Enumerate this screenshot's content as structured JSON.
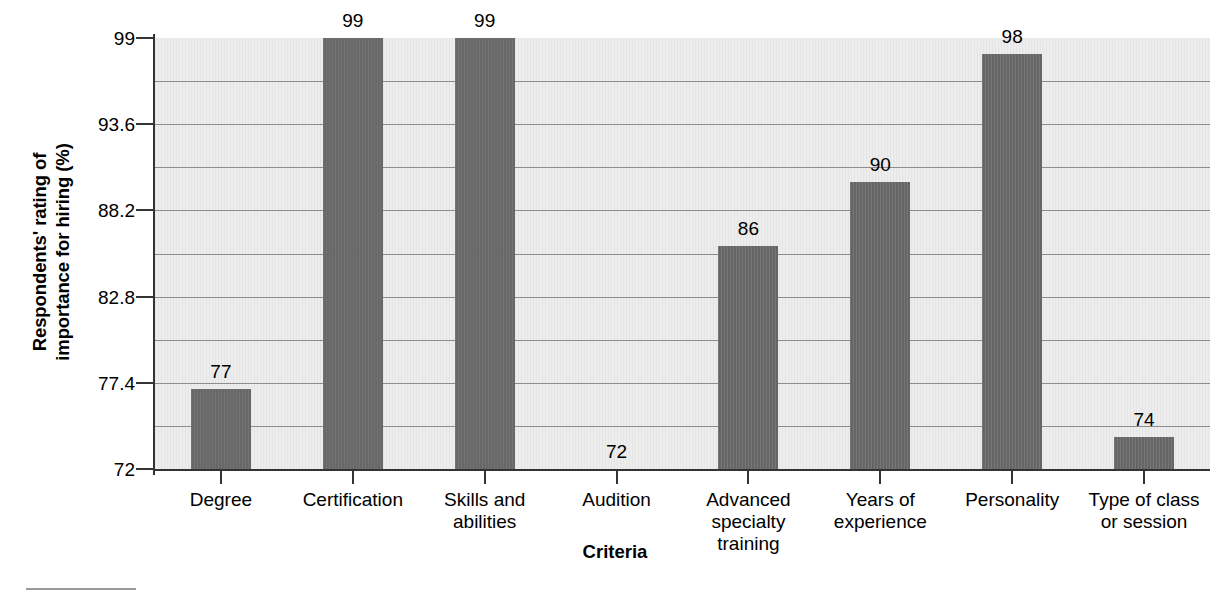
{
  "chart_data": {
    "type": "bar",
    "title": "",
    "xlabel": "Criteria",
    "ylabel": "Respondents' rating of importance for hiring (%)",
    "ylabel_lines": [
      "Respondents' rating of",
      "importance for hiring (%)"
    ],
    "categories": [
      "Degree",
      "Certification",
      "Skills and abilities",
      "Audition",
      "Advanced specialty training",
      "Years of experience",
      "Personality",
      "Type of class or session"
    ],
    "category_lines": [
      [
        "Degree"
      ],
      [
        "Certification"
      ],
      [
        "Skills and",
        "abilities"
      ],
      [
        "Audition"
      ],
      [
        "Advanced",
        "specialty training"
      ],
      [
        "Years of",
        "experience"
      ],
      [
        "Personality"
      ],
      [
        "Type of class",
        "or session"
      ]
    ],
    "values": [
      77,
      99,
      99,
      72,
      86,
      90,
      98,
      74
    ],
    "value_labels": [
      "77",
      "99",
      "99",
      "72",
      "86",
      "90",
      "98",
      "74"
    ],
    "ylim": [
      72,
      99
    ],
    "ytick_values": [
      99,
      93.6,
      88.2,
      82.8,
      77.4,
      72
    ],
    "ytick_labels": [
      "99",
      "93.6",
      "88.2",
      "82.8",
      "77.4",
      "72"
    ],
    "gridlines_at": [
      96.3,
      90.9,
      85.5,
      80.1,
      74.7
    ],
    "grid": true,
    "legend": "none",
    "bar_color": "#6d6d6d",
    "plot_background": "#ededed",
    "gridline_color": "#8e8e8e",
    "axis_color": "#333333"
  },
  "axis": {
    "x_title": "Criteria",
    "y_title_line1": "Respondents' rating of",
    "y_title_line2": "importance for hiring (%)"
  },
  "footnote": {
    "rule": ""
  }
}
